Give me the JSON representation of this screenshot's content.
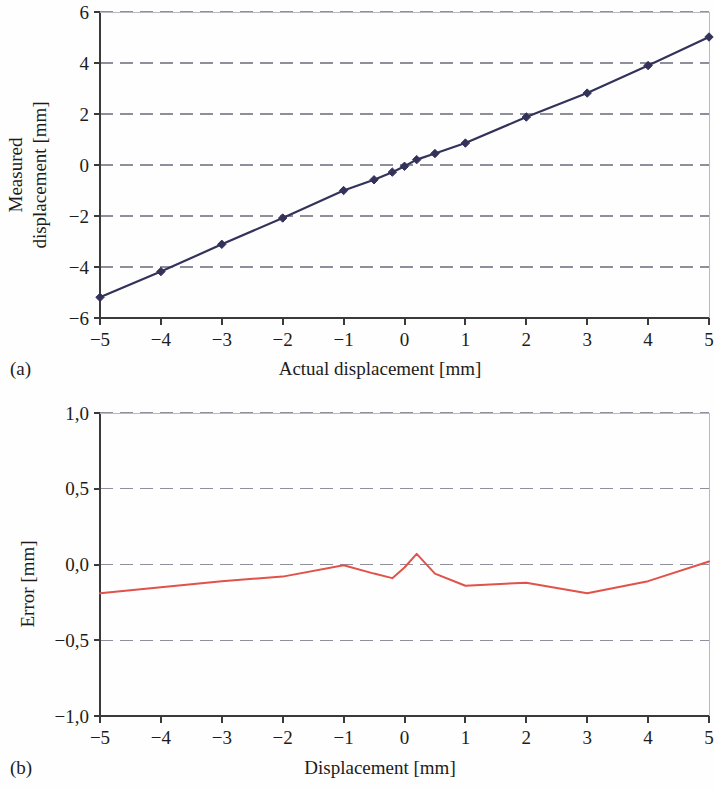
{
  "figure": {
    "panel_a_label": "(a)",
    "panel_b_label": "(b)"
  },
  "chart_data": [
    {
      "id": "chart-a",
      "type": "line",
      "title": "",
      "xlabel": "Actual displacement [mm]",
      "ylabel_line1": "Measured",
      "ylabel_line2": "displacement [mm]",
      "xlim": [
        -5,
        5
      ],
      "ylim": [
        -6,
        6
      ],
      "xticks": [
        -5,
        -4,
        -3,
        -2,
        -1,
        0,
        1,
        2,
        3,
        4,
        5
      ],
      "xtick_labels": [
        "−5",
        "−4",
        "−3",
        "−2",
        "−1",
        "0",
        "1",
        "2",
        "3",
        "4",
        "5"
      ],
      "yticks": [
        -6,
        -4,
        -2,
        0,
        2,
        4,
        6
      ],
      "ytick_labels": [
        "−6",
        "−4",
        "−2",
        "0",
        "2",
        "4",
        "6"
      ],
      "grid": "horizontal-dashed",
      "grid_color": "#8f8f9c",
      "series_color": "#32325a",
      "marker": "diamond",
      "legend": "none",
      "x": [
        -5,
        -4,
        -3,
        -2,
        -1,
        -0.5,
        -0.2,
        0,
        0.2,
        0.5,
        1,
        2,
        3,
        4,
        5
      ],
      "y": [
        -5.19,
        -4.18,
        -3.11,
        -2.08,
        -1.0,
        -0.58,
        -0.28,
        -0.05,
        0.21,
        0.45,
        0.86,
        1.88,
        2.82,
        3.9,
        5.02
      ]
    },
    {
      "id": "chart-b",
      "type": "line",
      "title": "",
      "xlabel": "Displacement [mm]",
      "ylabel_line1": "Error [mm]",
      "ylabel_line2": "",
      "xlim": [
        -5,
        5
      ],
      "ylim": [
        -1.0,
        1.0
      ],
      "xticks": [
        -5,
        -4,
        -3,
        -2,
        -1,
        0,
        1,
        2,
        3,
        4,
        5
      ],
      "xtick_labels": [
        "−5",
        "−4",
        "−3",
        "−2",
        "−1",
        "0",
        "1",
        "2",
        "3",
        "4",
        "5"
      ],
      "yticks": [
        -1.0,
        -0.5,
        0.0,
        0.5,
        1.0
      ],
      "ytick_labels": [
        "−1,0",
        "−0,5",
        "0,0",
        "0,5",
        "1,0"
      ],
      "grid": "horizontal-dashed",
      "grid_color": "#8f8f9c",
      "series_color": "#e0524a",
      "marker": "none",
      "legend": "none",
      "x": [
        -5,
        -4,
        -3,
        -2,
        -1,
        -0.5,
        -0.2,
        0,
        0.2,
        0.5,
        1,
        2,
        3,
        4,
        5
      ],
      "y": [
        -0.19,
        -0.15,
        -0.11,
        -0.08,
        -0.005,
        -0.06,
        -0.09,
        -0.02,
        0.07,
        -0.06,
        -0.14,
        -0.12,
        -0.19,
        -0.11,
        0.02
      ]
    }
  ]
}
